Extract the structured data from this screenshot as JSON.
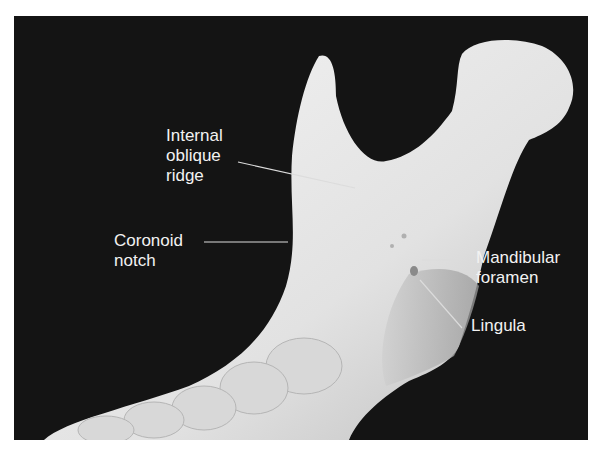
{
  "figure": {
    "labels": [
      {
        "id": "internal-oblique-ridge",
        "text": "Internal\noblique\nridge"
      },
      {
        "id": "coronoid-notch",
        "text": "Coronoid\nnotch"
      },
      {
        "id": "mandibular-foramen",
        "text": "Mandibular\nforamen"
      },
      {
        "id": "lingula",
        "text": "Lingula"
      }
    ],
    "colors": {
      "background": "#141414",
      "bone": "#e6e6e6",
      "label_text": "#f2f2f2",
      "leader_line": "#dcdcdc"
    }
  }
}
